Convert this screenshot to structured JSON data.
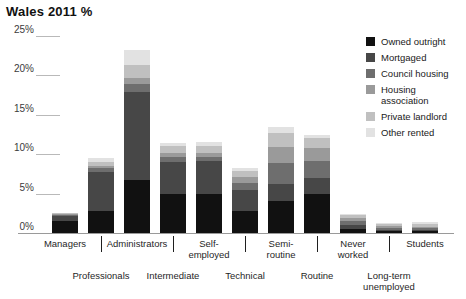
{
  "chart_data": {
    "type": "bar",
    "title": "Wales 2011 %",
    "xlabel": "",
    "ylabel": "",
    "ylim": [
      0,
      25
    ],
    "stacked": true,
    "grid": true,
    "legend_position": "right",
    "ytick_labels": [
      "25%",
      "20%",
      "15%",
      "10%",
      "5%",
      "0%"
    ],
    "ytick_values": [
      25,
      20,
      15,
      10,
      5,
      0
    ],
    "categories": [
      "Managers",
      "Professionals",
      "Administrators",
      "Intermediate",
      "Self-employed",
      "Technical",
      "Semi-routine",
      "Routine",
      "Never worked",
      "Long-term unemployed",
      "Students"
    ],
    "category_labels_top": [
      "Managers",
      "Administrators",
      "Self-\nemployed",
      "Semi-\nroutine",
      "Never\nworked",
      "Students"
    ],
    "category_labels_bottom": [
      "Professionals",
      "Intermediate",
      "Technical",
      "Routine",
      "Long-term\nunemployed"
    ],
    "series": [
      {
        "name": "Owned outright",
        "color": "#111111",
        "values": [
          1.5,
          2.8,
          6.7,
          5.0,
          4.9,
          2.8,
          4.0,
          5.0,
          0.5,
          0.2,
          0.2
        ]
      },
      {
        "name": "Mortgaged",
        "color": "#474747",
        "values": [
          0.7,
          5.0,
          11.2,
          4.0,
          4.3,
          2.6,
          2.2,
          2.0,
          0.5,
          0.2,
          0.2
        ]
      },
      {
        "name": "Council housing",
        "color": "#6e6e6e",
        "values": [
          0.1,
          0.4,
          1.0,
          0.7,
          0.5,
          1.0,
          2.7,
          2.2,
          0.5,
          0.3,
          0.2
        ]
      },
      {
        "name": "Housing association",
        "color": "#9a9a9a",
        "values": [
          0.1,
          0.3,
          0.8,
          0.5,
          0.4,
          0.7,
          2.0,
          1.6,
          0.4,
          0.2,
          0.2
        ]
      },
      {
        "name": "Private landlord",
        "color": "#c0c0c0",
        "values": [
          0.1,
          0.5,
          1.6,
          0.8,
          0.9,
          0.8,
          1.8,
          1.3,
          0.4,
          0.3,
          0.4
        ]
      },
      {
        "name": "Other rented",
        "color": "#e2e2e2",
        "values": [
          0.1,
          0.5,
          1.9,
          0.4,
          0.5,
          0.4,
          0.8,
          0.4,
          0.1,
          0.1,
          0.2
        ]
      }
    ],
    "totals": [
      2.6,
      9.5,
      23.2,
      11.4,
      11.5,
      8.3,
      13.5,
      12.5,
      2.4,
      1.3,
      1.4
    ]
  },
  "legend": {
    "entries": [
      {
        "label": "Owned outright",
        "color": "#111111"
      },
      {
        "label": "Mortgaged",
        "color": "#474747"
      },
      {
        "label": "Council housing",
        "color": "#6e6e6e"
      },
      {
        "label": "Housing association",
        "color": "#9a9a9a"
      },
      {
        "label": "Private landlord",
        "color": "#c0c0c0"
      },
      {
        "label": "Other rented",
        "color": "#e2e2e2"
      }
    ]
  }
}
